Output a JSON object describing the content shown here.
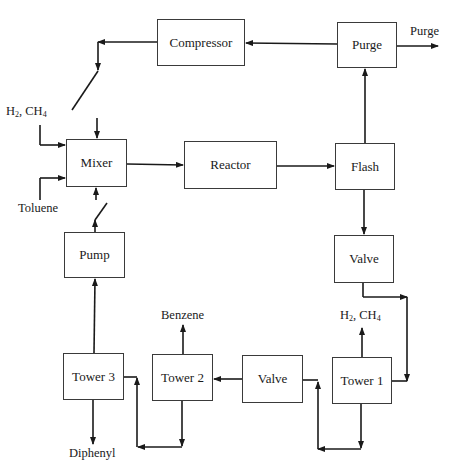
{
  "diagram": {
    "type": "process-flow",
    "units": {
      "compressor": {
        "label": "Compressor",
        "x": 157,
        "y": 19,
        "w": 88,
        "h": 47
      },
      "purge": {
        "label": "Purge",
        "x": 337,
        "y": 22,
        "w": 60,
        "h": 46
      },
      "mixer": {
        "label": "Mixer",
        "x": 66,
        "y": 139,
        "w": 61,
        "h": 48
      },
      "reactor": {
        "label": "Reactor",
        "x": 184,
        "y": 141,
        "w": 93,
        "h": 48
      },
      "flash": {
        "label": "Flash",
        "x": 335,
        "y": 143,
        "w": 60,
        "h": 47
      },
      "valve_1": {
        "label": "Valve",
        "x": 334,
        "y": 235,
        "w": 60,
        "h": 48
      },
      "pump": {
        "label": "Pump",
        "x": 64,
        "y": 232,
        "w": 61,
        "h": 46
      },
      "tower_3": {
        "label": "Tower 3",
        "x": 63,
        "y": 353,
        "w": 61,
        "h": 47
      },
      "tower_2": {
        "label": "Tower 2",
        "x": 152,
        "y": 354,
        "w": 61,
        "h": 47
      },
      "valve_2": {
        "label": "Valve",
        "x": 242,
        "y": 355,
        "w": 61,
        "h": 48
      },
      "tower_1": {
        "label": "Tower 1",
        "x": 332,
        "y": 357,
        "w": 60,
        "h": 47
      }
    },
    "stream_labels": {
      "purge_out": "Purge",
      "feed_h2_main": "H",
      "feed_h2_sub": "2",
      "feed_ch4_main": ", CH",
      "feed_ch4_sub": "4",
      "toluene": "Toluene",
      "tower1_top_h2_main": "H",
      "tower1_top_h2_sub": "2",
      "tower1_top_ch4_main": ", CH",
      "tower1_top_ch4_sub": "4",
      "benzene": "Benzene",
      "diphenyl": "Diphenyl"
    },
    "streams": [
      {
        "from": "flash",
        "to": "purge"
      },
      {
        "from": "purge",
        "to": "compressor"
      },
      {
        "from": "purge",
        "to": "purge_out"
      },
      {
        "from": "compressor",
        "to": "mixer"
      },
      {
        "from": "feed_h2_ch4",
        "to": "mixer"
      },
      {
        "from": "toluene",
        "to": "mixer"
      },
      {
        "from": "mixer",
        "to": "reactor"
      },
      {
        "from": "reactor",
        "to": "flash"
      },
      {
        "from": "flash",
        "to": "valve_1"
      },
      {
        "from": "valve_1",
        "to": "tower_1"
      },
      {
        "from": "tower_1",
        "to": "h2_ch4_out"
      },
      {
        "from": "tower_1",
        "to": "valve_2"
      },
      {
        "from": "valve_2",
        "to": "tower_2"
      },
      {
        "from": "tower_2",
        "to": "benzene"
      },
      {
        "from": "tower_2",
        "to": "tower_3"
      },
      {
        "from": "tower_3",
        "to": "diphenyl"
      },
      {
        "from": "tower_3",
        "to": "pump"
      },
      {
        "from": "pump",
        "to": "mixer"
      }
    ]
  }
}
